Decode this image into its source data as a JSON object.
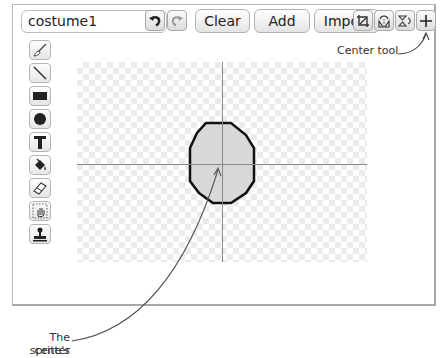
{
  "editor": {
    "costume_name": "costume1",
    "buttons": {
      "undo": "undo-icon",
      "redo": "redo-icon",
      "clear": "Clear",
      "add": "Add",
      "import": "Import"
    },
    "right_tools": [
      "crop-icon",
      "flip-horizontal-icon",
      "flip-vertical-icon",
      "center-tool-icon"
    ],
    "left_tools": [
      "paintbrush-icon",
      "line-icon",
      "rectangle-icon",
      "ellipse-icon",
      "text-icon",
      "paint-bucket-icon",
      "eraser-icon",
      "select-icon",
      "stamp-icon"
    ]
  },
  "annotations": {
    "center_tool": "Center tool",
    "sprite_center_line1": "The sprite's",
    "sprite_center_line2": "center"
  },
  "colors": {
    "shape_fill": "#d8d8d8",
    "shape_outline": "#111111",
    "crosshair": "#8a8a8a",
    "checker": "#ebebeb"
  }
}
